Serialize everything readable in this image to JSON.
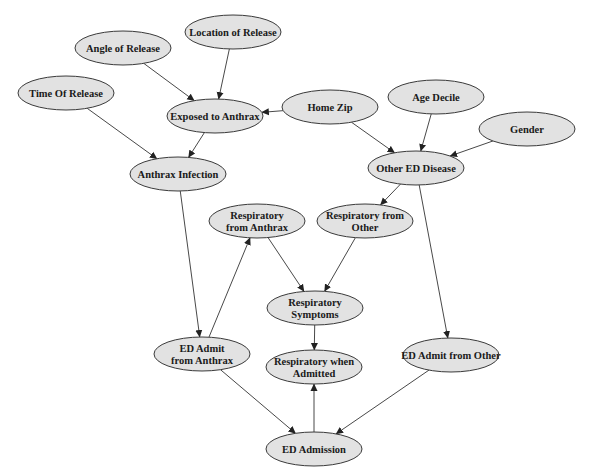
{
  "diagram": {
    "type": "bayesian-network",
    "colors": {
      "node_fill": "#e2e2e2",
      "node_stroke": "#3a3a3a",
      "edge": "#333333",
      "background": "#ffffff"
    },
    "nodes": [
      {
        "id": "location",
        "lines": [
          "Location of Release"
        ],
        "cx": 233,
        "cy": 32,
        "rx": 48,
        "ry": 17
      },
      {
        "id": "angle",
        "lines": [
          "Angle of Release"
        ],
        "cx": 123,
        "cy": 48,
        "rx": 48,
        "ry": 17
      },
      {
        "id": "time",
        "lines": [
          "Time Of Release"
        ],
        "cx": 66,
        "cy": 93,
        "rx": 48,
        "ry": 17
      },
      {
        "id": "exposed",
        "lines": [
          "Exposed to Anthrax"
        ],
        "cx": 215,
        "cy": 116,
        "rx": 48,
        "ry": 17
      },
      {
        "id": "homezip",
        "lines": [
          "Home Zip"
        ],
        "cx": 330,
        "cy": 107,
        "rx": 48,
        "ry": 17
      },
      {
        "id": "agedecile",
        "lines": [
          "Age Decile"
        ],
        "cx": 436,
        "cy": 97,
        "rx": 48,
        "ry": 17
      },
      {
        "id": "gender",
        "lines": [
          "Gender"
        ],
        "cx": 527,
        "cy": 129,
        "rx": 48,
        "ry": 17
      },
      {
        "id": "infection",
        "lines": [
          "Anthrax Infection"
        ],
        "cx": 178,
        "cy": 174,
        "rx": 48,
        "ry": 17
      },
      {
        "id": "otherdisease",
        "lines": [
          "Other ED Disease"
        ],
        "cx": 416,
        "cy": 168,
        "rx": 48,
        "ry": 17
      },
      {
        "id": "respanthrax",
        "lines": [
          "Respiratory",
          "from Anthrax"
        ],
        "cx": 257,
        "cy": 221,
        "rx": 48,
        "ry": 17
      },
      {
        "id": "respother",
        "lines": [
          "Respiratory from",
          "Other"
        ],
        "cx": 365,
        "cy": 221,
        "rx": 48,
        "ry": 17
      },
      {
        "id": "respsymptoms",
        "lines": [
          "Respiratory",
          "Symptoms"
        ],
        "cx": 315,
        "cy": 308,
        "rx": 48,
        "ry": 17
      },
      {
        "id": "edadmitanthrax",
        "lines": [
          "ED Admit",
          "from Anthrax"
        ],
        "cx": 202,
        "cy": 354,
        "rx": 48,
        "ry": 17
      },
      {
        "id": "respadmitted",
        "lines": [
          "Respiratory when",
          "Admitted"
        ],
        "cx": 314,
        "cy": 367,
        "rx": 48,
        "ry": 17
      },
      {
        "id": "edadmitother",
        "lines": [
          "ED Admit from Other"
        ],
        "cx": 451,
        "cy": 355,
        "rx": 48,
        "ry": 17
      },
      {
        "id": "edadmission",
        "lines": [
          "ED Admission"
        ],
        "cx": 314,
        "cy": 449,
        "rx": 48,
        "ry": 17
      }
    ],
    "edges": [
      {
        "from": "angle",
        "to": "exposed"
      },
      {
        "from": "location",
        "to": "exposed"
      },
      {
        "from": "homezip",
        "to": "exposed"
      },
      {
        "from": "time",
        "to": "infection"
      },
      {
        "from": "exposed",
        "to": "infection"
      },
      {
        "from": "homezip",
        "to": "otherdisease"
      },
      {
        "from": "agedecile",
        "to": "otherdisease"
      },
      {
        "from": "gender",
        "to": "otherdisease"
      },
      {
        "from": "otherdisease",
        "to": "respother"
      },
      {
        "from": "otherdisease",
        "to": "edadmitother"
      },
      {
        "from": "infection",
        "to": "edadmitanthrax"
      },
      {
        "from": "edadmitanthrax",
        "to": "respanthrax"
      },
      {
        "from": "respanthrax",
        "to": "respsymptoms"
      },
      {
        "from": "respother",
        "to": "respsymptoms"
      },
      {
        "from": "respsymptoms",
        "to": "respadmitted"
      },
      {
        "from": "edadmitanthrax",
        "to": "edadmission"
      },
      {
        "from": "edadmitother",
        "to": "edadmission"
      },
      {
        "from": "edadmission",
        "to": "respadmitted"
      }
    ]
  }
}
